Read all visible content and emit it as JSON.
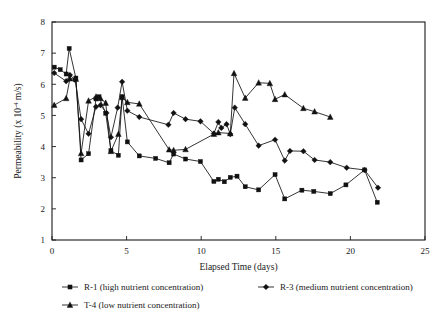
{
  "chart_data": {
    "type": "line",
    "title": "",
    "xlabel": "Elapsed Time (days)",
    "ylabel": "Permeability  (x 10",
    "ylabel_exponent": "-4",
    "ylabel_tail": " m/s)",
    "xlim": [
      0,
      25
    ],
    "ylim": [
      1,
      8
    ],
    "xticks": [
      0,
      5,
      10,
      15,
      20,
      25
    ],
    "xtick_labels": [
      "0",
      "5",
      "10",
      "15",
      "20",
      "25"
    ],
    "yticks": [
      1,
      2,
      3,
      4,
      5,
      6,
      7,
      8
    ],
    "ytick_labels": [
      "1",
      "2",
      "3",
      "4",
      "5",
      "6",
      "7",
      "8"
    ],
    "grid": false,
    "legend_position": "below-axes",
    "series": [
      {
        "name": "R-1 (high nutrient concentration)",
        "short_name": "R-1",
        "marker": "square",
        "color": "#111111",
        "points": [
          [
            0.15,
            6.55
          ],
          [
            0.55,
            6.47
          ],
          [
            0.95,
            6.33
          ],
          [
            1.15,
            7.15
          ],
          [
            1.6,
            6.2
          ],
          [
            1.95,
            3.57
          ],
          [
            2.45,
            3.77
          ],
          [
            2.95,
            5.53
          ],
          [
            3.15,
            5.6
          ],
          [
            3.6,
            5.07
          ],
          [
            3.95,
            3.87
          ],
          [
            4.45,
            3.72
          ],
          [
            4.7,
            5.6
          ],
          [
            5.05,
            4.15
          ],
          [
            5.85,
            3.7
          ],
          [
            6.95,
            3.62
          ],
          [
            7.85,
            3.48
          ],
          [
            8.15,
            3.76
          ],
          [
            8.95,
            3.6
          ],
          [
            9.95,
            3.52
          ],
          [
            10.85,
            2.88
          ],
          [
            11.15,
            2.95
          ],
          [
            11.55,
            2.87
          ],
          [
            11.95,
            3.01
          ],
          [
            12.4,
            3.05
          ],
          [
            12.95,
            2.71
          ],
          [
            13.85,
            2.61
          ],
          [
            14.95,
            3.1
          ],
          [
            15.6,
            2.32
          ],
          [
            16.75,
            2.6
          ],
          [
            17.55,
            2.56
          ],
          [
            18.65,
            2.49
          ],
          [
            19.7,
            2.77
          ],
          [
            20.95,
            3.25
          ],
          [
            21.8,
            2.21
          ]
        ]
      },
      {
        "name": "R-3 (medium nutrient concentration)",
        "short_name": "R-3",
        "marker": "diamond",
        "color": "#111111",
        "points": [
          [
            0.15,
            6.36
          ],
          [
            0.95,
            6.1
          ],
          [
            1.2,
            6.3
          ],
          [
            1.55,
            6.14
          ],
          [
            1.95,
            4.88
          ],
          [
            2.45,
            4.41
          ],
          [
            2.95,
            5.28
          ],
          [
            3.25,
            5.33
          ],
          [
            3.65,
            5.08
          ],
          [
            3.95,
            4.3
          ],
          [
            4.4,
            5.25
          ],
          [
            4.7,
            6.08
          ],
          [
            5.05,
            5.15
          ],
          [
            5.85,
            4.95
          ],
          [
            7.8,
            4.7
          ],
          [
            8.15,
            5.08
          ],
          [
            8.95,
            4.88
          ],
          [
            9.95,
            4.81
          ],
          [
            10.85,
            4.42
          ],
          [
            11.15,
            4.79
          ],
          [
            11.35,
            4.6
          ],
          [
            11.7,
            4.72
          ],
          [
            11.95,
            4.4
          ],
          [
            12.25,
            5.25
          ],
          [
            12.95,
            4.72
          ],
          [
            13.85,
            4.03
          ],
          [
            14.95,
            4.22
          ],
          [
            15.6,
            3.55
          ],
          [
            15.95,
            3.86
          ],
          [
            16.85,
            3.85
          ],
          [
            17.6,
            3.57
          ],
          [
            18.65,
            3.5
          ],
          [
            19.75,
            3.32
          ],
          [
            20.95,
            3.25
          ],
          [
            21.85,
            2.68
          ]
        ]
      },
      {
        "name": "T-4 (low nutrient concentration)",
        "short_name": "T-4",
        "marker": "triangle",
        "color": "#111111",
        "points": [
          [
            0.15,
            5.33
          ],
          [
            0.95,
            5.55
          ],
          [
            1.2,
            6.18
          ],
          [
            1.6,
            6.17
          ],
          [
            1.95,
            3.78
          ],
          [
            2.45,
            5.47
          ],
          [
            2.95,
            5.6
          ],
          [
            3.25,
            5.55
          ],
          [
            3.6,
            5.4
          ],
          [
            3.95,
            3.85
          ],
          [
            4.45,
            4.4
          ],
          [
            4.7,
            5.58
          ],
          [
            5.05,
            5.42
          ],
          [
            5.85,
            5.37
          ],
          [
            7.85,
            3.9
          ],
          [
            8.15,
            3.88
          ],
          [
            8.95,
            3.91
          ],
          [
            10.85,
            4.4
          ],
          [
            11.15,
            4.45
          ],
          [
            11.95,
            4.42
          ],
          [
            12.2,
            6.35
          ],
          [
            12.95,
            5.56
          ],
          [
            13.85,
            6.05
          ],
          [
            14.6,
            6.03
          ],
          [
            14.95,
            5.52
          ],
          [
            15.6,
            5.67
          ],
          [
            16.85,
            5.23
          ],
          [
            17.6,
            5.12
          ],
          [
            18.65,
            4.95
          ]
        ]
      }
    ]
  },
  "legend": {
    "entries": [
      {
        "label": "R-1 (high nutrient concentration)",
        "marker": "square"
      },
      {
        "label": "R-3 (medium nutrient concentration)",
        "marker": "diamond"
      },
      {
        "label": "T-4 (low nutrient concentration)",
        "marker": "triangle"
      }
    ]
  }
}
